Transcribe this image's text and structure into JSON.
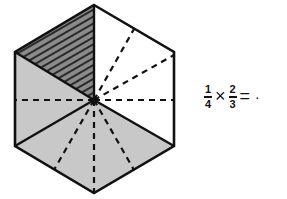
{
  "figure": {
    "shape": "regular hexagon",
    "divisions": "6 equal triangles from center, each further subdivided by dashed lines",
    "colors": {
      "stroke": "#111111",
      "shaded": "#c8c8c8",
      "hatched": "#8a8a8a",
      "background": "#ffffff"
    },
    "regions": [
      {
        "name": "upper-left triangle",
        "fill": "hatched"
      },
      {
        "name": "upper-right triangle",
        "fill": "none"
      },
      {
        "name": "right triangle",
        "fill": "none"
      },
      {
        "name": "lower-right triangle",
        "fill": "shaded"
      },
      {
        "name": "lower-left triangle",
        "fill": "shaded"
      },
      {
        "name": "left triangle",
        "fill": "shaded"
      }
    ]
  },
  "equation": {
    "frac1": {
      "num": "1",
      "den": "4"
    },
    "times": "×",
    "frac2": {
      "num": "2",
      "den": "3"
    },
    "equals": "=",
    "answer": "·"
  }
}
